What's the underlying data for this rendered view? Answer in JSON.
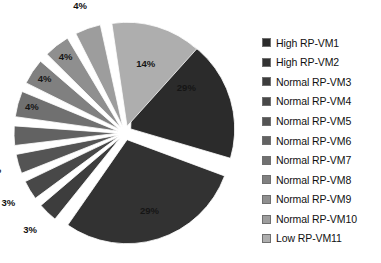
{
  "chart_data": {
    "type": "pie",
    "title": "",
    "legend_position": "right",
    "grid": false,
    "labels_show_percent": true,
    "categories": [
      "High RP-VM1",
      "High RP-VM2",
      "Normal RP-VM3",
      "Normal RP-VM4",
      "Normal RP-VM5",
      "Normal RP-VM6",
      "Normal RP-VM7",
      "Normal RP-VM8",
      "Normal RP-VM9",
      "Normal RP-VM10",
      "Low RP-VM11"
    ],
    "values": [
      29,
      29,
      3,
      3,
      3,
      3,
      4,
      4,
      4,
      4,
      14
    ],
    "value_labels": [
      "29%",
      "29%",
      "3%",
      "3%",
      "3%",
      "3%",
      "4%",
      "4%",
      "4%",
      "4%",
      "14%"
    ],
    "colors": [
      "#2b2b2b",
      "#323232",
      "#3d3d3d",
      "#484848",
      "#545454",
      "#626262",
      "#707070",
      "#808080",
      "#8f8f8f",
      "#9d9d9d",
      "#aeaeae"
    ],
    "slices": [
      {
        "label": "High RP-VM1",
        "value": 29,
        "value_label": "29%",
        "color": "#2b2b2b",
        "start_deg": -88.0,
        "end_deg": 16.4,
        "explode": 7,
        "label_r": 0.66,
        "label_outside": false
      },
      {
        "label": "High RP-VM2",
        "value": 29,
        "value_label": "29%",
        "color": "#323232",
        "start_deg": 20.4,
        "end_deg": 124.8,
        "explode": 7,
        "label_r": 0.72,
        "label_outside": false
      },
      {
        "label": "Normal RP-VM3",
        "value": 3,
        "value_label": "3%",
        "color": "#3d3d3d",
        "start_deg": 128.8,
        "end_deg": 139.6,
        "explode": 7,
        "label_r": 1.24,
        "label_outside": true
      },
      {
        "label": "Normal RP-VM4",
        "value": 3,
        "value_label": "3%",
        "color": "#484848",
        "start_deg": 143.6,
        "end_deg": 154.4,
        "explode": 7,
        "label_r": 1.24,
        "label_outside": true
      },
      {
        "label": "Normal RP-VM5",
        "value": 3,
        "value_label": "3%",
        "color": "#545454",
        "start_deg": 158.4,
        "end_deg": 169.2,
        "explode": 7,
        "label_r": 1.24,
        "label_outside": true
      },
      {
        "label": "Normal RP-VM6",
        "value": 3,
        "value_label": "3%",
        "color": "#626262",
        "start_deg": 173.2,
        "end_deg": 184.0,
        "explode": 7,
        "label_r": 1.22,
        "label_outside": true
      },
      {
        "label": "Normal RP-VM7",
        "value": 4,
        "value_label": "4%",
        "color": "#707070",
        "start_deg": 188.0,
        "end_deg": 202.4,
        "explode": 7,
        "label_r": 0.86,
        "label_outside": false
      },
      {
        "label": "Normal RP-VM8",
        "value": 4,
        "value_label": "4%",
        "color": "#808080",
        "start_deg": 206.4,
        "end_deg": 220.8,
        "explode": 7,
        "label_r": 0.86,
        "label_outside": false
      },
      {
        "label": "Normal RP-VM9",
        "value": 4,
        "value_label": "4%",
        "color": "#8f8f8f",
        "start_deg": 224.8,
        "end_deg": 239.2,
        "explode": 7,
        "label_r": 0.86,
        "label_outside": false
      },
      {
        "label": "Normal RP-VM10",
        "value": 4,
        "value_label": "4%",
        "color": "#9d9d9d",
        "start_deg": 243.2,
        "end_deg": 257.6,
        "explode": 7,
        "label_r": 1.22,
        "label_outside": true
      },
      {
        "label": "Low RP-VM11",
        "value": 14,
        "value_label": "14%",
        "color": "#aeaeae",
        "start_deg": 261.6,
        "end_deg": 312.0,
        "explode": 7,
        "label_r": 0.62,
        "label_outside": false
      }
    ],
    "geometry": {
      "cx": 125,
      "cy": 133,
      "r": 104
    }
  },
  "legend": {
    "items": [
      {
        "label": "High RP-VM1",
        "color": "#2b2b2b"
      },
      {
        "label": "High RP-VM2",
        "color": "#323232"
      },
      {
        "label": "Normal RP-VM3",
        "color": "#3d3d3d"
      },
      {
        "label": "Normal RP-VM4",
        "color": "#484848"
      },
      {
        "label": "Normal RP-VM5",
        "color": "#545454"
      },
      {
        "label": "Normal RP-VM6",
        "color": "#626262"
      },
      {
        "label": "Normal RP-VM7",
        "color": "#707070"
      },
      {
        "label": "Normal RP-VM8",
        "color": "#808080"
      },
      {
        "label": "Normal RP-VM9",
        "color": "#8f8f8f"
      },
      {
        "label": "Normal RP-VM10",
        "color": "#9d9d9d"
      },
      {
        "label": "Low RP-VM11",
        "color": "#aeaeae"
      }
    ]
  }
}
